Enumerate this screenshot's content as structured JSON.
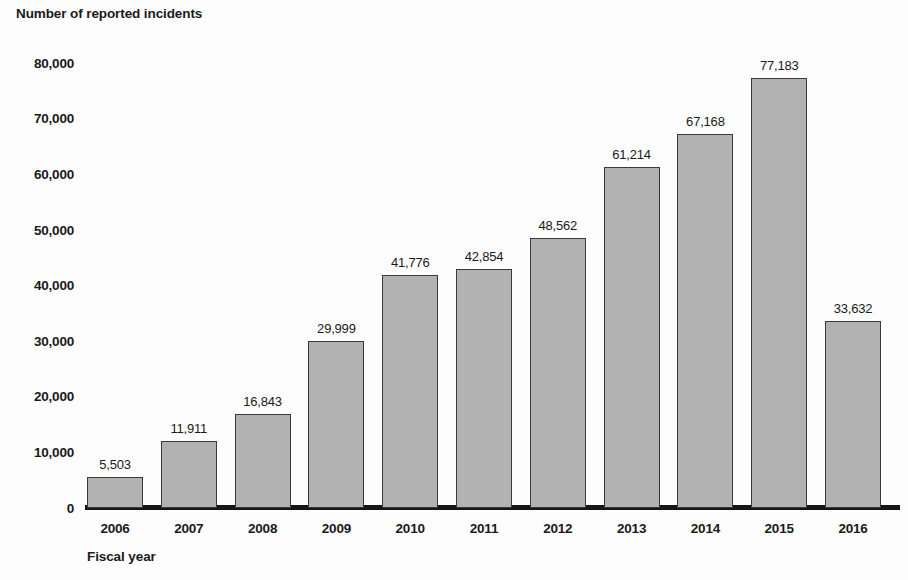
{
  "chart_data": {
    "type": "bar",
    "title": "",
    "xlabel": "Fiscal year",
    "ylabel": "Number of reported incidents",
    "categories": [
      "2006",
      "2007",
      "2008",
      "2009",
      "2010",
      "2011",
      "2012",
      "2013",
      "2014",
      "2015",
      "2016"
    ],
    "values": [
      5503,
      11911,
      16843,
      29999,
      41776,
      42854,
      48562,
      61214,
      67168,
      77183,
      33632
    ],
    "value_labels": [
      "5,503",
      "11,911",
      "16,843",
      "29,999",
      "41,776",
      "42,854",
      "48,562",
      "61,214",
      "67,168",
      "77,183",
      "33,632"
    ],
    "ylim": [
      0,
      80000
    ],
    "y_ticks": [
      0,
      10000,
      20000,
      30000,
      40000,
      50000,
      60000,
      70000,
      80000
    ],
    "y_tick_labels": [
      "0",
      "10,000",
      "20,000",
      "30,000",
      "40,000",
      "50,000",
      "60,000",
      "70,000",
      "80,000"
    ],
    "grid": false,
    "legend": false,
    "bar_color": "#b2b2b2",
    "bar_border_color": "#3a3a3a",
    "axis_color": "#161616",
    "text_color": "#1a1a1a"
  }
}
